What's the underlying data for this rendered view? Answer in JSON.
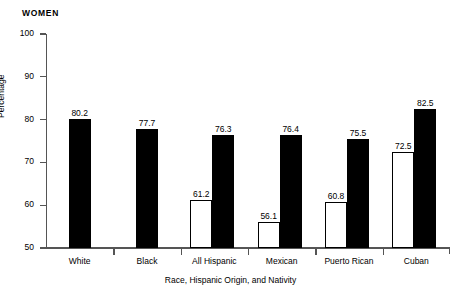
{
  "panel": {
    "title": "WOMEN"
  },
  "chart_data": {
    "type": "bar",
    "title": "WOMEN",
    "xlabel": "Race, Hispanic Origin, and Nativity",
    "ylabel": "Percentage",
    "ylim": [
      50,
      100
    ],
    "yticks": [
      50,
      60,
      70,
      80,
      90,
      100
    ],
    "grid": false,
    "legend": "none",
    "categories": [
      "White",
      "Black",
      "All Hispanic",
      "Mexican",
      "Puerto Rican",
      "Cuban"
    ],
    "series": [
      {
        "name": "open-bar",
        "style": "white-fill-black-outline",
        "values": [
          null,
          null,
          61.2,
          56.1,
          60.8,
          72.5
        ]
      },
      {
        "name": "filled-bar",
        "style": "black-fill",
        "values": [
          80.2,
          77.7,
          76.3,
          76.4,
          75.5,
          82.5
        ]
      }
    ],
    "bars": [
      {
        "category": "White",
        "series": "filled-bar",
        "value": 80.2,
        "label": "80.2"
      },
      {
        "category": "Black",
        "series": "filled-bar",
        "value": 77.7,
        "label": "77.7"
      },
      {
        "category": "All Hispanic",
        "series": "open-bar",
        "value": 61.2,
        "label": "61.2"
      },
      {
        "category": "All Hispanic",
        "series": "filled-bar",
        "value": 76.3,
        "label": "76.3"
      },
      {
        "category": "Mexican",
        "series": "open-bar",
        "value": 56.1,
        "label": "56.1"
      },
      {
        "category": "Mexican",
        "series": "filled-bar",
        "value": 76.4,
        "label": "76.4"
      },
      {
        "category": "Puerto Rican",
        "series": "open-bar",
        "value": 60.8,
        "label": "60.8"
      },
      {
        "category": "Puerto Rican",
        "series": "filled-bar",
        "value": 75.5,
        "label": "75.5"
      },
      {
        "category": "Cuban",
        "series": "open-bar",
        "value": 72.5,
        "label": "72.5"
      },
      {
        "category": "Cuban",
        "series": "filled-bar",
        "value": 82.5,
        "label": "82.5"
      }
    ],
    "ytick_labels": [
      "50",
      "60",
      "70",
      "80",
      "90",
      "100"
    ],
    "colors": {
      "filled": "#000000",
      "open": "#ffffff",
      "outline": "#000000",
      "axis": "#555555"
    }
  }
}
